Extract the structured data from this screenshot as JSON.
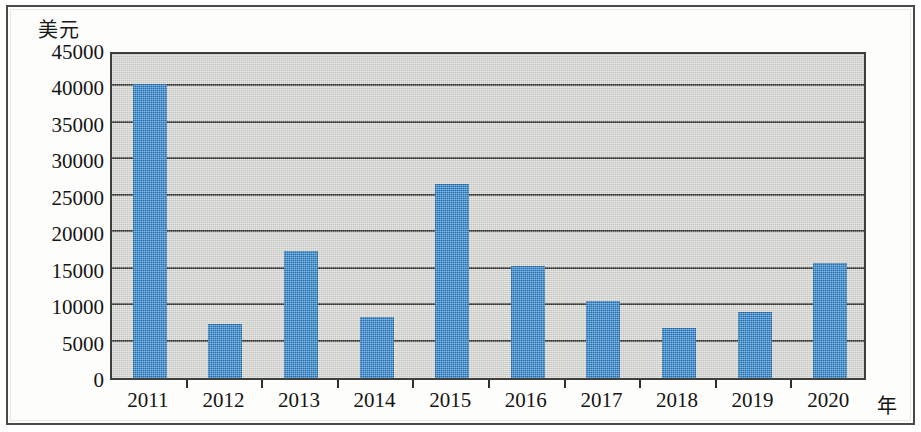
{
  "chart_data": {
    "type": "bar",
    "title": "",
    "subtitle": "",
    "xlabel": "年",
    "ylabel": "美元",
    "categories": [
      "2011",
      "2012",
      "2013",
      "2014",
      "2015",
      "2016",
      "2017",
      "2018",
      "2019",
      "2020"
    ],
    "values": [
      40300,
      7400,
      17400,
      8400,
      26600,
      15400,
      10500,
      6900,
      9000,
      15800
    ],
    "series": [
      {
        "name": "美元",
        "values": [
          40300,
          7400,
          17400,
          8400,
          26600,
          15400,
          10500,
          6900,
          9000,
          15800
        ]
      }
    ],
    "ylim": [
      0,
      45000
    ],
    "ytick_values": [
      0,
      5000,
      10000,
      15000,
      20000,
      25000,
      30000,
      35000,
      40000,
      45000
    ],
    "ytick_labels": [
      "0",
      "5000",
      "10000",
      "15000",
      "20000",
      "25000",
      "30000",
      "35000",
      "40000",
      "45000"
    ],
    "grid": true,
    "grid_axis": "y",
    "legend": false,
    "legend_position": "none",
    "bar_color": "#2077c0",
    "plot_background": "#d3d3cf",
    "axis_color": "#2e2e2b",
    "figure_background": "#fdfdfb"
  }
}
